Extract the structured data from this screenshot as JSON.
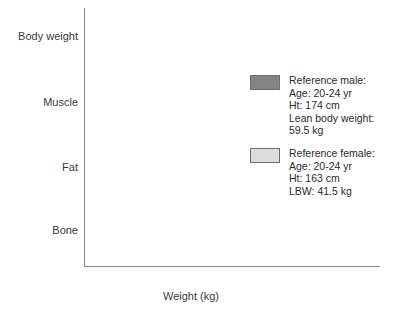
{
  "chart_data": {
    "type": "bar",
    "orientation": "horizontal",
    "title": "",
    "xlabel": "Weight (kg)",
    "ylabel": "",
    "xlim": [
      0,
      72
    ],
    "xticks": [
      0,
      10,
      20,
      30,
      40,
      50,
      60,
      70
    ],
    "xtick_labels": [
      "",
      "10",
      "20",
      "30",
      "40",
      "50",
      "60",
      "70"
    ],
    "grid": false,
    "legend_position": "right",
    "categories": [
      "Body weight",
      "Muscle",
      "Fat",
      "Bone"
    ],
    "series": [
      {
        "name": "Reference male",
        "color": "#848484",
        "values": [
          70.0,
          31.0,
          10.5,
          11.0
        ],
        "labels": [
          "",
          "(45%)",
          "(15%)",
          "(15%)"
        ]
      },
      {
        "name": "Reference female",
        "color": "#dcdcdc",
        "values": [
          58.5,
          20.5,
          16.5,
          5.5
        ],
        "labels": [
          "",
          "(36%)",
          "(27%)",
          "(12%)"
        ]
      }
    ]
  },
  "axis": {
    "x_title": "Weight (kg)",
    "ticks": [
      {
        "value": 0,
        "label": ""
      },
      {
        "value": 10,
        "label": "10"
      },
      {
        "value": 20,
        "label": "20"
      },
      {
        "value": 30,
        "label": "30"
      },
      {
        "value": 40,
        "label": "40"
      },
      {
        "value": 50,
        "label": "50"
      },
      {
        "value": 60,
        "label": "60"
      },
      {
        "value": 70,
        "label": "70"
      }
    ]
  },
  "categories": [
    {
      "label": "Body weight"
    },
    {
      "label": "Muscle"
    },
    {
      "label": "Fat"
    },
    {
      "label": "Bone"
    }
  ],
  "bar_labels": {
    "muscle_male": "(45%)",
    "muscle_female": "(36%)",
    "fat_male": "(15%)",
    "fat_female": "(27%)",
    "bone_male": "(15%)",
    "bone_female": "(12%)"
  },
  "legend": {
    "male": {
      "color": "#848484",
      "text": "Reference male:\nAge: 20-24 yr\nHt: 174 cm\nLean body weight:\n   59.5 kg"
    },
    "female": {
      "color": "#dcdcdc",
      "text": "Reference female:\nAge: 20-24 yr\nHt: 163 cm\nLBW: 41.5 kg"
    }
  }
}
